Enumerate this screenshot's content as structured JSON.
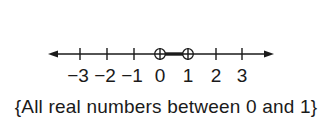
{
  "number_line": {
    "axis": {
      "y": 54,
      "x_start": 48,
      "x_end": 274,
      "arrows": "both",
      "color": "#1a1a1a"
    },
    "ticks": [
      {
        "value": -3,
        "label": "−3",
        "x": 80
      },
      {
        "value": -2,
        "label": "−2",
        "x": 107
      },
      {
        "value": -1,
        "label": "−1",
        "x": 134
      },
      {
        "value": 0,
        "label": "0",
        "x": 160
      },
      {
        "value": 1,
        "label": "1",
        "x": 188
      },
      {
        "value": 2,
        "label": "2",
        "x": 216
      },
      {
        "value": 3,
        "label": "3",
        "x": 242
      }
    ],
    "open_endpoints": [
      0,
      1
    ],
    "shaded_interval": {
      "from": 0,
      "to": 1
    }
  },
  "caption": "{All real numbers between 0 and 1}"
}
